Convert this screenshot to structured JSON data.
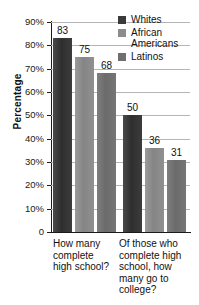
{
  "chart_data": {
    "type": "bar",
    "title": "",
    "xlabel": "",
    "ylabel": "Percentage",
    "ylim": [
      0,
      90
    ],
    "grid": true,
    "legend_position": "top-right",
    "categories": [
      "How many complete high school?",
      "Of those who complete high school, how many go to college?"
    ],
    "series": [
      {
        "name": "Whites",
        "values": [
          83,
          50
        ]
      },
      {
        "name": "African Americans",
        "values": [
          75,
          36
        ]
      },
      {
        "name": "Latinos",
        "values": [
          68,
          31
        ]
      }
    ],
    "ytick_labels": [
      "90%",
      "80%",
      "70%",
      "60%",
      "50%",
      "40%",
      "30%",
      "20%",
      "10%",
      "0"
    ],
    "ytick_values": [
      90,
      80,
      70,
      60,
      50,
      40,
      30,
      20,
      10,
      0
    ]
  },
  "axis": {
    "y_title": "Percentage",
    "ticks": [
      {
        "label": "90%",
        "value": 90
      },
      {
        "label": "80%",
        "value": 80
      },
      {
        "label": "70%",
        "value": 70
      },
      {
        "label": "60%",
        "value": 60
      },
      {
        "label": "50%",
        "value": 50
      },
      {
        "label": "40%",
        "value": 40
      },
      {
        "label": "30%",
        "value": 30
      },
      {
        "label": "20%",
        "value": 20
      },
      {
        "label": "10%",
        "value": 10
      },
      {
        "label": "0",
        "value": 0
      }
    ]
  },
  "legend": {
    "items": [
      {
        "label": "Whites",
        "color": "#3a3a3a",
        "swatch": "whites-swatch-icon"
      },
      {
        "label": "African Americans",
        "color": "#8c8c8c",
        "swatch": "african-americans-swatch-icon"
      },
      {
        "label": "Latinos",
        "color": "#6f6f6f",
        "swatch": "latinos-swatch-icon"
      }
    ]
  },
  "groups": [
    {
      "label": "How many complete high school?",
      "bars": [
        {
          "series": "Whites",
          "value": 83,
          "label": "83"
        },
        {
          "series": "African Americans",
          "value": 75,
          "label": "75"
        },
        {
          "series": "Latinos",
          "value": 68,
          "label": "68"
        }
      ]
    },
    {
      "label": "Of those who complete high school, how many go to college?",
      "bars": [
        {
          "series": "Whites",
          "value": 50,
          "label": "50"
        },
        {
          "series": "African Americans",
          "value": 36,
          "label": "36"
        },
        {
          "series": "Latinos",
          "value": 31,
          "label": "31"
        }
      ]
    }
  ],
  "colors": {
    "whites": "#3a3a3a",
    "african_americans": "#8c8c8c",
    "latinos": "#6f6f6f",
    "gridline": "#b5b5b5",
    "axis": "#1a1a1a",
    "background": "#ffffff"
  }
}
